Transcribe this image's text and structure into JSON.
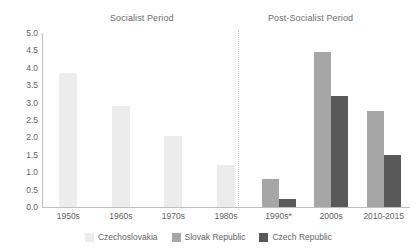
{
  "chart_data": {
    "type": "bar",
    "title": "",
    "xlabel": "",
    "ylabel": "",
    "ylim": [
      0,
      5.0
    ],
    "ytick_step": 0.5,
    "grid": false,
    "legend_position": "bottom",
    "categories": [
      "1950s",
      "1960s",
      "1970s",
      "1980s",
      "1990s*",
      "2000s",
      "2010-2015"
    ],
    "yticks": [
      "0.0",
      "0.5",
      "1.0",
      "1.5",
      "2.0",
      "2.5",
      "3.0",
      "3.5",
      "4.0",
      "4.5",
      "5.0"
    ],
    "series": [
      {
        "name": "Czechoslovakia",
        "color": "#ececec",
        "values": [
          3.85,
          2.9,
          2.05,
          1.2,
          null,
          null,
          null
        ]
      },
      {
        "name": "Slovak Republic",
        "color": "#a6a6a6",
        "values": [
          null,
          null,
          null,
          null,
          0.8,
          4.45,
          2.75
        ]
      },
      {
        "name": "Czech Republic",
        "color": "#595959",
        "values": [
          null,
          null,
          null,
          null,
          0.22,
          3.2,
          1.5
        ]
      }
    ],
    "annotations": [
      {
        "name": "socialist-period-title",
        "text": "Socialist Period"
      },
      {
        "name": "post-socialist-period-title",
        "text": "Post-Socialist Period"
      }
    ]
  },
  "sections": {
    "socialist": "Socialist Period",
    "post_socialist": "Post-Socialist Period"
  },
  "legend": {
    "items": [
      {
        "label": "Czechoslovakia",
        "color": "#ececec"
      },
      {
        "label": "Slovak Republic",
        "color": "#a6a6a6"
      },
      {
        "label": "Czech Republic",
        "color": "#595959"
      }
    ]
  }
}
